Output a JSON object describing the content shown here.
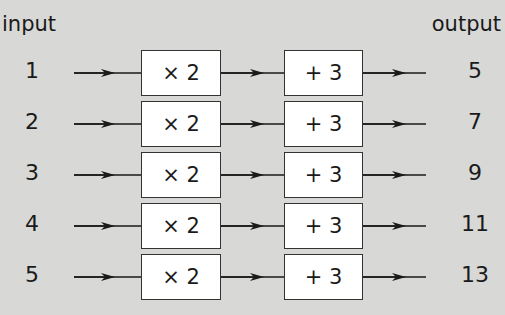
{
  "header": {
    "input_label": "input",
    "output_label": "output"
  },
  "operations": {
    "first": "× 2",
    "second": "+ 3"
  },
  "rows": [
    {
      "input": "1",
      "op1": "× 2",
      "op2": "+ 3",
      "output": "5"
    },
    {
      "input": "2",
      "op1": "× 2",
      "op2": "+ 3",
      "output": "7"
    },
    {
      "input": "3",
      "op1": "× 2",
      "op2": "+ 3",
      "output": "9"
    },
    {
      "input": "4",
      "op1": "× 2",
      "op2": "+ 3",
      "output": "11"
    },
    {
      "input": "5",
      "op1": "× 2",
      "op2": "+ 3",
      "output": "13"
    }
  ],
  "colors": {
    "background": "#d8d8d6",
    "box_fill": "#ffffff",
    "stroke": "#1a1a1a"
  }
}
